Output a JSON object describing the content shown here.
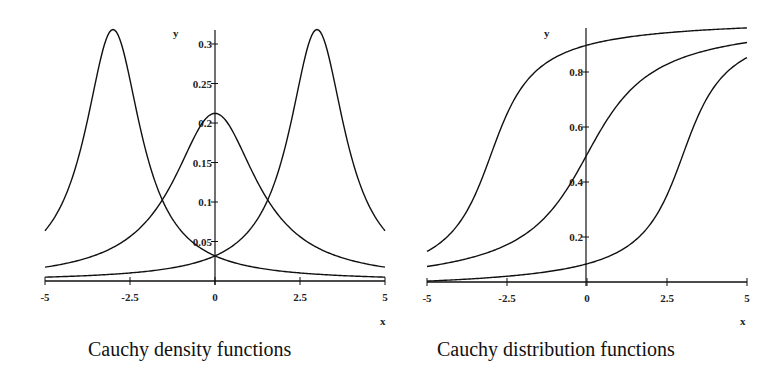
{
  "chart_data": [
    {
      "type": "line",
      "title": "Cauchy density functions",
      "xlabel": "x",
      "ylabel": "y",
      "xlim": [
        -5,
        5
      ],
      "ylim": [
        0,
        0.32
      ],
      "grid": false,
      "legend": null,
      "x_ticks": [
        -5,
        -2.5,
        0,
        2.5,
        5
      ],
      "x_tick_labels": [
        "-5",
        "-2.5",
        "0",
        "2.5",
        "5"
      ],
      "y_ticks": [
        0.05,
        0.1,
        0.15,
        0.2,
        0.25,
        0.3
      ],
      "y_tick_labels": [
        "0.05",
        "0.1",
        "0.15",
        "0.2",
        "0.25",
        "0.3"
      ],
      "series": [
        {
          "name": "Cauchy density, location -3, scale 1",
          "location": -3,
          "scale": 1,
          "x": [
            -5,
            -4,
            -3,
            -2,
            -1,
            0,
            1,
            2,
            3,
            4,
            5
          ],
          "values": [
            0.064,
            0.159,
            0.318,
            0.159,
            0.064,
            0.032,
            0.019,
            0.012,
            0.009,
            0.006,
            0.005
          ]
        },
        {
          "name": "Cauchy density, location 0, scale 1.5",
          "location": 0,
          "scale": 1.5,
          "x": [
            -5,
            -4,
            -3,
            -2,
            -1,
            0,
            1,
            2,
            3,
            4,
            5
          ],
          "values": [
            0.018,
            0.026,
            0.042,
            0.076,
            0.147,
            0.212,
            0.147,
            0.076,
            0.042,
            0.026,
            0.018
          ]
        },
        {
          "name": "Cauchy density, location 3, scale 1",
          "location": 3,
          "scale": 1,
          "x": [
            -5,
            -4,
            -3,
            -2,
            -1,
            0,
            1,
            2,
            3,
            4,
            5
          ],
          "values": [
            0.005,
            0.006,
            0.009,
            0.012,
            0.019,
            0.032,
            0.064,
            0.159,
            0.318,
            0.159,
            0.064
          ]
        }
      ]
    },
    {
      "type": "line",
      "title": "Cauchy distribution functions",
      "xlabel": "x",
      "ylabel": "y",
      "xlim": [
        -5,
        5
      ],
      "ylim": [
        0.04,
        0.96
      ],
      "grid": false,
      "legend": null,
      "x_ticks": [
        -5,
        -2.5,
        0,
        2.5,
        5
      ],
      "x_tick_labels": [
        "-5",
        "-2.5",
        "0",
        "2.5",
        "5"
      ],
      "y_ticks": [
        0.2,
        0.4,
        0.6,
        0.8
      ],
      "y_tick_labels": [
        "0.2",
        "0.4",
        "0.6",
        "0.8"
      ],
      "series": [
        {
          "name": "Cauchy CDF, location -3, scale 1",
          "location": -3,
          "scale": 1,
          "x": [
            -5,
            -4,
            -3,
            -2,
            -1,
            0,
            1,
            2,
            3,
            4,
            5
          ],
          "values": [
            0.148,
            0.25,
            0.5,
            0.75,
            0.852,
            0.898,
            0.922,
            0.937,
            0.947,
            0.955,
            0.96
          ]
        },
        {
          "name": "Cauchy CDF, location 0, scale 1.5",
          "location": 0,
          "scale": 1.5,
          "x": [
            -5,
            -4,
            -3,
            -2,
            -1,
            0,
            1,
            2,
            3,
            4,
            5
          ],
          "values": [
            0.092,
            0.114,
            0.148,
            0.205,
            0.313,
            0.5,
            0.687,
            0.795,
            0.852,
            0.886,
            0.908
          ]
        },
        {
          "name": "Cauchy CDF, location 3, scale 1",
          "location": 3,
          "scale": 1,
          "x": [
            -5,
            -4,
            -3,
            -2,
            -1,
            0,
            1,
            2,
            3,
            4,
            5
          ],
          "values": [
            0.04,
            0.045,
            0.053,
            0.063,
            0.078,
            0.102,
            0.148,
            0.25,
            0.5,
            0.75,
            0.852
          ]
        }
      ]
    }
  ],
  "captions": {
    "left": "Cauchy density functions",
    "right": "Cauchy distribution functions"
  },
  "layout": {
    "panels": [
      {
        "x0px": 45,
        "x1px": 385,
        "yaxis_px": 215,
        "axis_y_px": 281,
        "y_zero_px": 281,
        "y_scale_px": 790,
        "yaxis_top_px": 30,
        "ylabel_pos": [
          173,
          37
        ],
        "xlabel_pos": [
          380,
          325
        ]
      },
      {
        "x0px": 427,
        "x1px": 747,
        "yaxis_px": 586,
        "axis_y_px": 282,
        "y_zero_px": 292,
        "y_scale_px": 275,
        "yaxis_top_px": 28,
        "ylabel_pos": [
          544,
          37
        ],
        "xlabel_pos": [
          740,
          325
        ]
      }
    ],
    "line_color": "#111111"
  }
}
